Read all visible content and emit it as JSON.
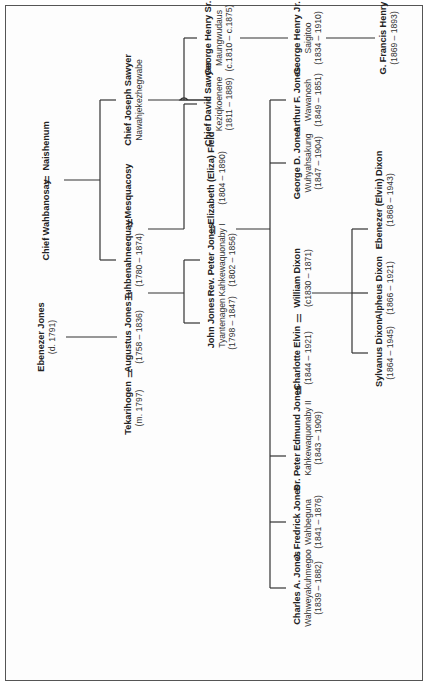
{
  "diagram": {
    "type": "family-tree",
    "orientation": "rotated-90-ccw",
    "marriage_symbol": "=",
    "line_color": "#333333",
    "text_color": "#222222"
  },
  "people": {
    "ebenezer_jones": {
      "name": "Ebenezer Jones",
      "date": "(d. 1791)"
    },
    "chief_wahbanosay": {
      "name": "Chief Wahbanosay"
    },
    "naishenum": {
      "name": "Naishenum"
    },
    "tekarihogen": {
      "name": "Tekarihogen",
      "date": "(m. 1797)"
    },
    "augustus_jones": {
      "name": "Augustus Jones",
      "date": "(1758 – 1836)"
    },
    "tuhbenahneequay": {
      "name": "Tuhbenahneequay",
      "date": "(1780 – 1874)"
    },
    "mesquacosy": {
      "name": "Mesquacosy"
    },
    "chief_joseph_sawyer": {
      "name": "Chief Joseph Sawyer",
      "alt": "Nawahjekezhegwabe"
    },
    "john_jones": {
      "name": "John Jones",
      "alt": "Tyantenagen",
      "date": "(1798 – 1847)"
    },
    "rev_peter_jones": {
      "name": "Rev. Peter Jones",
      "alt": "Kahkewaquonaby I",
      "date": "(1802 – 1856)"
    },
    "elizabeth_field": {
      "name": "Elizabeth (Eliza) Field",
      "date": "(1804 – 1890)"
    },
    "chief_david_sawyer": {
      "name": "Chief David Sawyer",
      "alt": "Keziqkoenene",
      "date": "(1811 – 1889)"
    },
    "george_henry_sr": {
      "name": "George Henry Sr.",
      "alt": "Maungwudaus",
      "date": "(c.1810 – c.1875)"
    },
    "charles_a_jones": {
      "name": "Charles A. Jones",
      "alt": "Wahweyakuhmegoo",
      "date": "(1839 – 1882)"
    },
    "j_fredrick_jones": {
      "name": "J. Fredrick Jones",
      "alt": "Wahbeguna",
      "date": "(1841 – 1876)"
    },
    "dr_peter_edmund_jones": {
      "name": "Dr. Peter Edmund Jones",
      "alt": "Kahkewaquonaby II",
      "date": "(1843 – 1909)"
    },
    "charlotte_elvin": {
      "name": "Charlotte Elvin",
      "date": "(1844 – 1921)"
    },
    "william_dixon": {
      "name": "William Dixon",
      "date": "(c1830 – 1871)"
    },
    "george_d_jones": {
      "name": "George D. Jones",
      "alt": "Wuhyahsakung",
      "date": "(1847 – 1904)"
    },
    "arthur_f_jones": {
      "name": "Arthur F. Jones",
      "alt": "Wawanosh",
      "date": "(1849 – 1851)"
    },
    "george_henry_jr": {
      "name": "George Henry Jr.",
      "alt": "Saigitoo",
      "date": "(1834 – 1910)"
    },
    "sylvanus_dixon": {
      "name": "Sylvanus Dixon",
      "date": "(1864 – 1945)"
    },
    "alpheus_dixon": {
      "name": "Alpheus Dixon",
      "date": "(1866 – 1921)"
    },
    "ebenezer_elvin_dixon": {
      "name": "Ebenezer (Elvin) Dixon",
      "date": "(1868 – 1943)"
    },
    "g_francis_henry": {
      "name": "G. Francis Henry",
      "date": "(1869 – 1893)"
    }
  },
  "marriages": [
    {
      "a": "Chief Wahbanosay",
      "b": "Naishenum"
    },
    {
      "a": "Tekarihogen",
      "b": "Augustus Jones"
    },
    {
      "a": "Augustus Jones",
      "b": "Tuhbenahneequay"
    },
    {
      "a": "Tuhbenahneequay",
      "b": "Mesquacosy"
    },
    {
      "a": "Rev. Peter Jones",
      "b": "Elizabeth (Eliza) Field"
    },
    {
      "a": "Dr. Peter Edmund Jones",
      "b": "Charlotte Elvin"
    },
    {
      "a": "Charlotte Elvin",
      "b": "William Dixon"
    }
  ],
  "descents": [
    {
      "from": "Ebenezer Jones",
      "to": [
        "Augustus Jones"
      ]
    },
    {
      "from": "Chief Wahbanosay = Naishenum",
      "to": [
        "Tuhbenahneequay",
        "Chief Joseph Sawyer"
      ]
    },
    {
      "from": "Augustus Jones = Tuhbenahneequay",
      "to": [
        "John Jones",
        "Rev. Peter Jones"
      ]
    },
    {
      "from": "Mesquacosy",
      "to": [
        "Chief David Sawyer"
      ]
    },
    {
      "from": "Chief Joseph Sawyer",
      "to": [
        "George Henry Sr."
      ]
    },
    {
      "from": "Rev. Peter Jones = Elizabeth (Eliza) Field",
      "to": [
        "Charles A. Jones",
        "J. Fredrick Jones",
        "Dr. Peter Edmund Jones",
        "George D. Jones",
        "Arthur F. Jones"
      ]
    },
    {
      "from": "George Henry Sr.",
      "to": [
        "George Henry Jr."
      ]
    },
    {
      "from": "Charlotte Elvin = William Dixon",
      "to": [
        "Sylvanus Dixon",
        "Alpheus Dixon",
        "Ebenezer (Elvin) Dixon"
      ]
    },
    {
      "from": "George Henry Jr.",
      "to": [
        "G. Francis Henry"
      ]
    }
  ]
}
